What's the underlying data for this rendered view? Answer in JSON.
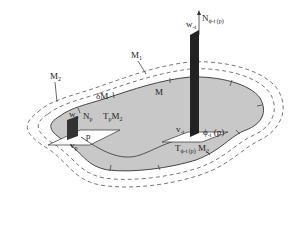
{
  "diagram": {
    "labels": {
      "M1": {
        "main": "M",
        "sub": "1"
      },
      "M2": {
        "main": "M",
        "sub": "2"
      },
      "boundary": "δM",
      "M": "M",
      "Np": {
        "main": "N",
        "sub": "p"
      },
      "wp": {
        "main": "w",
        "sub": "p"
      },
      "vp": {
        "main": "v",
        "sub": "p"
      },
      "p": "p",
      "TpM2": {
        "main": "T",
        "sub": "p",
        "tail": "M",
        "tail_sub": "2"
      },
      "N_phi": {
        "main": "N",
        "sub": "ϕ-t (p)"
      },
      "w_t": {
        "main": "w",
        "sub": "-t"
      },
      "v_t": {
        "main": "v",
        "sub": "-t"
      },
      "phi_p": {
        "main": "ϕ",
        "sub": "-t",
        "tail": " (p)"
      },
      "T_phi_M2": {
        "main": "T",
        "sub": "ϕ-t (p)",
        "tail": " M",
        "tail_sub": "2"
      }
    },
    "colors": {
      "region_fill": "#c8c8c8",
      "outline": "#444444",
      "dashed": "#666666",
      "plane_fill": "#ffffff",
      "normal_fill": "#222222"
    }
  }
}
